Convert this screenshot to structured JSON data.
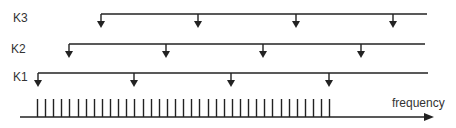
{
  "diagram": {
    "axis": {
      "label": "frequency",
      "x_start": 20,
      "x_end": 434,
      "y": 117,
      "color": "#222222"
    },
    "ticks": {
      "count": 37,
      "x_first": 37,
      "spacing": 8.12,
      "y_top": 99,
      "y_bottom": 117
    },
    "combs": [
      {
        "label": "K3",
        "label_x": 13,
        "label_y": 12,
        "line_y": 14,
        "x_start": 101,
        "x_end": 427,
        "arrows": [
          101,
          198,
          296,
          393
        ]
      },
      {
        "label": "K2",
        "label_x": 11,
        "label_y": 43,
        "line_y": 44,
        "x_start": 69,
        "x_end": 425,
        "arrows": [
          69,
          166,
          263,
          361
        ]
      },
      {
        "label": "K1",
        "label_x": 13,
        "label_y": 71,
        "line_y": 73,
        "x_start": 38,
        "x_end": 428,
        "arrows": [
          38,
          134,
          231,
          329
        ]
      }
    ],
    "stroke_color": "#222222"
  }
}
